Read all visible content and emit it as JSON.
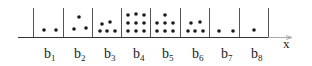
{
  "diagram": {
    "axis_label": "x",
    "bins": [
      {
        "label": "b",
        "subscript": "1",
        "count": 2
      },
      {
        "label": "b",
        "subscript": "2",
        "count": 3
      },
      {
        "label": "b",
        "subscript": "3",
        "count": 5
      },
      {
        "label": "b",
        "subscript": "4",
        "count": 9
      },
      {
        "label": "b",
        "subscript": "5",
        "count": 7
      },
      {
        "label": "b",
        "subscript": "6",
        "count": 5
      },
      {
        "label": "b",
        "subscript": "7",
        "count": 2
      },
      {
        "label": "b",
        "subscript": "8",
        "count": 1
      }
    ],
    "colors": {
      "ink": "#1a1a1a",
      "axis": "#333333",
      "arrow": "#999999"
    }
  }
}
